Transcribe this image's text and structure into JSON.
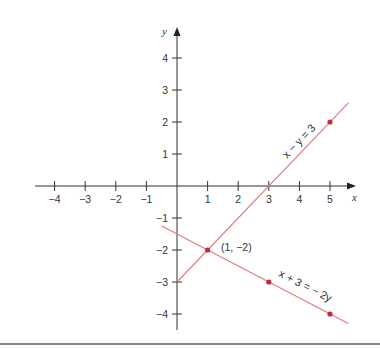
{
  "axes": {
    "x_label": "x",
    "y_label": "y",
    "x_ticks": [
      {
        "value": -4,
        "label": "−4"
      },
      {
        "value": -3,
        "label": "−3"
      },
      {
        "value": -2,
        "label": "−2"
      },
      {
        "value": -1,
        "label": "−1"
      },
      {
        "value": 1,
        "label": "1"
      },
      {
        "value": 2,
        "label": "2"
      },
      {
        "value": 3,
        "label": "3"
      },
      {
        "value": 4,
        "label": "4"
      },
      {
        "value": 5,
        "label": "5"
      }
    ],
    "y_ticks": [
      {
        "value": 4,
        "label": "4"
      },
      {
        "value": 3,
        "label": "3"
      },
      {
        "value": 2,
        "label": "2"
      },
      {
        "value": 1,
        "label": "1"
      },
      {
        "value": -1,
        "label": "−1"
      },
      {
        "value": -2,
        "label": "−2"
      },
      {
        "value": -3,
        "label": "−3"
      },
      {
        "value": -4,
        "label": "−4"
      }
    ]
  },
  "lines": [
    {
      "name": "line-x-minus-y",
      "equation": "x − y = 3",
      "from": [
        0,
        -3
      ],
      "to": [
        5.6,
        2.6
      ]
    },
    {
      "name": "line-x-plus-3",
      "equation": "x + 3 = − 2y",
      "from": [
        -0.5,
        -1.25
      ],
      "to": [
        5.6,
        -4.3
      ]
    }
  ],
  "points": [
    {
      "x": 1,
      "y": -2,
      "label": "(1, −2)"
    },
    {
      "x": 3,
      "y": -3,
      "label": ""
    },
    {
      "x": 5,
      "y": 2,
      "label": ""
    },
    {
      "x": 5,
      "y": -4,
      "label": ""
    }
  ],
  "colors": {
    "line": "#e07a7a",
    "point": "#c8283c",
    "axis": "#333333"
  }
}
